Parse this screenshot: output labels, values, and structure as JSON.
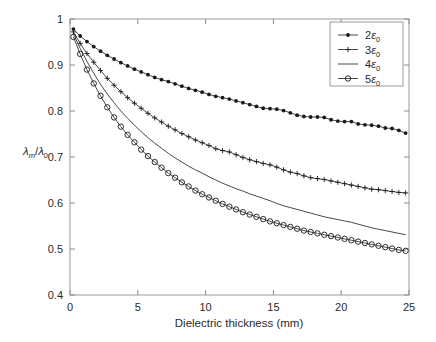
{
  "chart_data": {
    "type": "line",
    "title": "",
    "xlabel": "Dielectric thickness (mm)",
    "ylabel": "λₘ/λ₀",
    "ylabel_parts": {
      "lam1": "λ",
      "sub1": "m",
      "slash": "/",
      "lam2": "λ",
      "sub2": "0"
    },
    "xlim": [
      0,
      25
    ],
    "ylim": [
      0.4,
      1.0
    ],
    "xticks": [
      0,
      5,
      10,
      15,
      20,
      25
    ],
    "yticks": [
      0.4,
      0.5,
      0.6,
      0.7,
      0.8,
      0.9,
      1.0
    ],
    "xtick_labels": [
      "0",
      "5",
      "10",
      "15",
      "20",
      "25"
    ],
    "ytick_labels": [
      "0.4",
      "0.5",
      "0.6",
      "0.7",
      "0.8",
      "0.9",
      "1"
    ],
    "grid": false,
    "legend_position": "top-right",
    "legend_entries": [
      "2ε₀",
      "3ε₀",
      "4ε₀",
      "5ε₀"
    ],
    "x": [
      0.25,
      0.75,
      1.25,
      1.75,
      2.25,
      2.75,
      3.25,
      3.75,
      4.25,
      4.75,
      5.25,
      5.75,
      6.25,
      6.75,
      7.25,
      7.75,
      8.25,
      8.75,
      9.25,
      9.75,
      10.25,
      10.75,
      11.25,
      11.75,
      12.25,
      12.75,
      13.25,
      13.75,
      14.25,
      14.75,
      15.25,
      15.75,
      16.25,
      16.75,
      17.25,
      17.75,
      18.25,
      18.75,
      19.25,
      19.75,
      20.25,
      20.75,
      21.25,
      21.75,
      22.25,
      22.75,
      23.25,
      23.75,
      24.25,
      24.75
    ],
    "series": [
      {
        "name": "2ε₀",
        "eps": 2,
        "marker": "dot",
        "values": [
          0.978,
          0.963,
          0.951,
          0.94,
          0.93,
          0.921,
          0.913,
          0.905,
          0.898,
          0.891,
          0.885,
          0.879,
          0.873,
          0.868,
          0.864,
          0.859,
          0.854,
          0.849,
          0.845,
          0.841,
          0.836,
          0.832,
          0.829,
          0.826,
          0.822,
          0.818,
          0.814,
          0.81,
          0.806,
          0.805,
          0.804,
          0.801,
          0.796,
          0.791,
          0.788,
          0.787,
          0.787,
          0.786,
          0.781,
          0.778,
          0.777,
          0.777,
          0.772,
          0.77,
          0.769,
          0.767,
          0.763,
          0.762,
          0.758,
          0.752
        ]
      },
      {
        "name": "3ε₀",
        "eps": 3,
        "marker": "plus",
        "values": [
          0.972,
          0.947,
          0.925,
          0.906,
          0.888,
          0.871,
          0.856,
          0.842,
          0.829,
          0.817,
          0.806,
          0.795,
          0.785,
          0.776,
          0.767,
          0.759,
          0.751,
          0.744,
          0.737,
          0.731,
          0.725,
          0.718,
          0.714,
          0.711,
          0.705,
          0.699,
          0.694,
          0.69,
          0.686,
          0.683,
          0.678,
          0.672,
          0.667,
          0.664,
          0.659,
          0.655,
          0.653,
          0.651,
          0.648,
          0.645,
          0.642,
          0.639,
          0.636,
          0.633,
          0.63,
          0.629,
          0.627,
          0.625,
          0.623,
          0.622
        ]
      },
      {
        "name": "4ε₀",
        "eps": 4,
        "marker": "none",
        "values": [
          0.968,
          0.936,
          0.908,
          0.882,
          0.858,
          0.837,
          0.818,
          0.8,
          0.784,
          0.769,
          0.755,
          0.742,
          0.73,
          0.719,
          0.708,
          0.698,
          0.689,
          0.68,
          0.672,
          0.665,
          0.657,
          0.65,
          0.643,
          0.637,
          0.631,
          0.626,
          0.62,
          0.615,
          0.61,
          0.605,
          0.599,
          0.594,
          0.59,
          0.586,
          0.582,
          0.578,
          0.574,
          0.57,
          0.567,
          0.564,
          0.561,
          0.558,
          0.554,
          0.55,
          0.546,
          0.543,
          0.54,
          0.537,
          0.534,
          0.531
        ]
      },
      {
        "name": "5ε₀",
        "eps": 5,
        "marker": "circle",
        "values": [
          0.961,
          0.924,
          0.89,
          0.86,
          0.833,
          0.808,
          0.786,
          0.766,
          0.748,
          0.732,
          0.716,
          0.702,
          0.689,
          0.677,
          0.665,
          0.655,
          0.645,
          0.636,
          0.627,
          0.619,
          0.612,
          0.605,
          0.598,
          0.592,
          0.586,
          0.58,
          0.575,
          0.57,
          0.565,
          0.56,
          0.556,
          0.552,
          0.548,
          0.544,
          0.54,
          0.537,
          0.534,
          0.531,
          0.528,
          0.525,
          0.522,
          0.519,
          0.516,
          0.513,
          0.51,
          0.507,
          0.504,
          0.501,
          0.498,
          0.496
        ]
      }
    ]
  },
  "colors": {
    "line": "#222222",
    "axis": "#8c8c8c",
    "text": "#2a2a2a",
    "background": "#ffffff"
  }
}
